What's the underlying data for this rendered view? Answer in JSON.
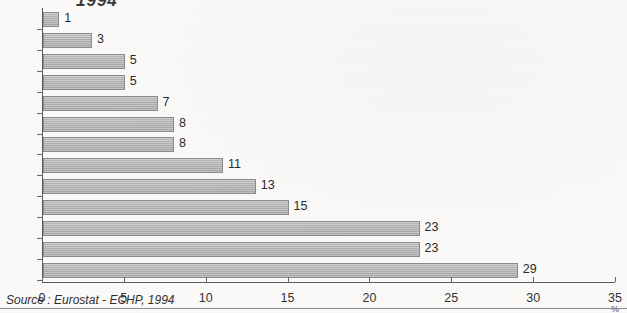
{
  "chart_data": {
    "type": "bar",
    "orientation": "horizontal",
    "title": "1994",
    "xlabel": "%",
    "ylabel": "",
    "xlim": [
      0,
      35
    ],
    "xticks": [
      0,
      5,
      10,
      15,
      20,
      25,
      30,
      35
    ],
    "grid": false,
    "legend": null,
    "categories": [
      "NL",
      "DK",
      "B",
      "UK",
      "D",
      "L",
      "F",
      "EU-12",
      "E",
      "IRL",
      "P",
      "I",
      "EL"
    ],
    "values": [
      1,
      3,
      5,
      5,
      7,
      8,
      8,
      11,
      13,
      15,
      23,
      23,
      29
    ],
    "data_labels": [
      "1",
      "3",
      "5",
      "5",
      "7",
      "8",
      "8",
      "11",
      "13",
      "15",
      "23",
      "23",
      "29"
    ],
    "unit_label": "%",
    "source_note": "Source : Eurostat - ECHP, 1994",
    "bar_color": "#b3b3b3",
    "axis_color": "#5a5a5a",
    "background": "#fbfaf8"
  }
}
